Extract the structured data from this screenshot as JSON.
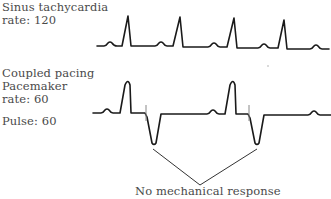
{
  "panels": [
    {
      "title": "Sinus tachycardia",
      "rate_label": "rate: 120"
    },
    {
      "title": "Coupled pacing",
      "subtitle": "Pacemaker",
      "rate_label": "rate: 60",
      "pulse_label": "Pulse: 60"
    }
  ],
  "annotation": {
    "text": "No mechanical response"
  },
  "colors": {
    "trace": "#1a1a1a",
    "text": "#4a4a4a",
    "pacing_spike": "#888888",
    "background": "#ffffff"
  }
}
